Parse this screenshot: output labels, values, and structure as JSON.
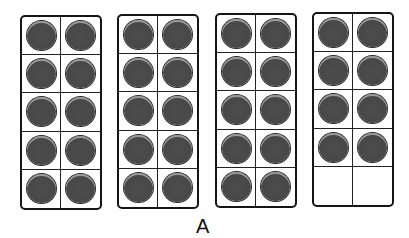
{
  "figure": {
    "type": "ten-frames",
    "label": "A",
    "counter_color": "#474747",
    "frames": [
      {
        "filled": 10,
        "capacity": 10
      },
      {
        "filled": 10,
        "capacity": 10
      },
      {
        "filled": 10,
        "capacity": 10
      },
      {
        "filled": 8,
        "capacity": 10
      }
    ],
    "total": 38
  }
}
